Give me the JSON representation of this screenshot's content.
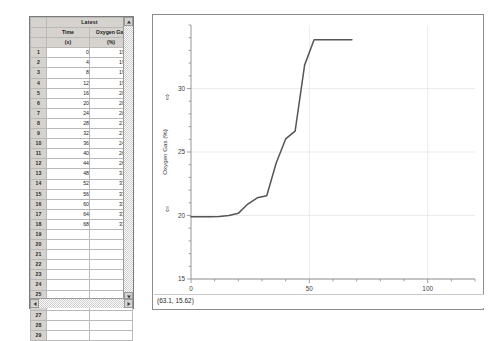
{
  "window": {
    "app": "data-collection-graph-window"
  },
  "table": {
    "title": "Latest",
    "columns": [
      {
        "name": "Time",
        "unit": "(s)"
      },
      {
        "name": "Oxygen Gas",
        "unit": "(%)"
      }
    ],
    "row_numbers": [
      1,
      2,
      3,
      4,
      5,
      6,
      7,
      8,
      9,
      10,
      11,
      12,
      13,
      14,
      15,
      16,
      17,
      18,
      19,
      20,
      21,
      22,
      23,
      24,
      25,
      26,
      27,
      28,
      29
    ],
    "rows": [
      {
        "n": "1",
        "time": "0",
        "oxygen": "19.90"
      },
      {
        "n": "2",
        "time": "4",
        "oxygen": "19.90"
      },
      {
        "n": "3",
        "time": "8",
        "oxygen": "19.90"
      },
      {
        "n": "4",
        "time": "12",
        "oxygen": "19.92"
      },
      {
        "n": "5",
        "time": "16",
        "oxygen": "20.00"
      },
      {
        "n": "6",
        "time": "20",
        "oxygen": "20.17"
      },
      {
        "n": "7",
        "time": "24",
        "oxygen": "20.90"
      },
      {
        "n": "8",
        "time": "28",
        "oxygen": "21.39"
      },
      {
        "n": "9",
        "time": "32",
        "oxygen": "21.56"
      },
      {
        "n": "10",
        "time": "36",
        "oxygen": "24.13"
      },
      {
        "n": "11",
        "time": "40",
        "oxygen": "26.03"
      },
      {
        "n": "12",
        "time": "44",
        "oxygen": "26.65"
      },
      {
        "n": "13",
        "time": "48",
        "oxygen": "31.84"
      },
      {
        "n": "14",
        "time": "52",
        "oxygen": "33.84"
      },
      {
        "n": "15",
        "time": "56",
        "oxygen": "33.84"
      },
      {
        "n": "16",
        "time": "60",
        "oxygen": "33.84"
      },
      {
        "n": "17",
        "time": "64",
        "oxygen": "33.84"
      },
      {
        "n": "18",
        "time": "68",
        "oxygen": "33.84"
      },
      {
        "n": "19",
        "time": "",
        "oxygen": ""
      },
      {
        "n": "20",
        "time": "",
        "oxygen": ""
      },
      {
        "n": "21",
        "time": "",
        "oxygen": ""
      },
      {
        "n": "22",
        "time": "",
        "oxygen": ""
      },
      {
        "n": "23",
        "time": "",
        "oxygen": ""
      },
      {
        "n": "24",
        "time": "",
        "oxygen": ""
      },
      {
        "n": "25",
        "time": "",
        "oxygen": ""
      },
      {
        "n": "26",
        "time": "",
        "oxygen": ""
      },
      {
        "n": "27",
        "time": "",
        "oxygen": ""
      },
      {
        "n": "28",
        "time": "",
        "oxygen": ""
      },
      {
        "n": "29",
        "time": "",
        "oxygen": ""
      }
    ]
  },
  "graph": {
    "status_coordinate": "(63.1, 15.62)",
    "x_arrow_left": "⟸",
    "x_arrow_right": "⟹",
    "y_arrow_up": "⇧",
    "y_arrow_down": "⇩"
  },
  "chart_data": {
    "type": "line",
    "title": "",
    "xlabel": "Time (s)",
    "ylabel": "Oxygen Gas (%)",
    "xlim": [
      0,
      120
    ],
    "ylim": [
      15,
      35
    ],
    "xticks": [
      0,
      50,
      100
    ],
    "xticks_minor_step": 10,
    "yticks": [
      15,
      20,
      25,
      30
    ],
    "yticks_minor_step": 1,
    "grid": true,
    "legend": "none",
    "line_color": "#555555",
    "x": [
      0,
      4,
      8,
      12,
      16,
      20,
      24,
      28,
      32,
      36,
      40,
      44,
      48,
      52,
      56,
      60,
      64,
      68
    ],
    "y": [
      19.9,
      19.9,
      19.9,
      19.92,
      20.0,
      20.17,
      20.9,
      21.39,
      21.56,
      24.13,
      26.03,
      26.65,
      31.84,
      33.84,
      33.84,
      33.84,
      33.84,
      33.84
    ],
    "series": [
      {
        "name": "Oxygen Gas (%)",
        "values": [
          19.9,
          19.9,
          19.9,
          19.92,
          20.0,
          20.17,
          20.9,
          21.39,
          21.56,
          24.13,
          26.03,
          26.65,
          31.84,
          33.84,
          33.84,
          33.84,
          33.84,
          33.84
        ]
      }
    ]
  }
}
